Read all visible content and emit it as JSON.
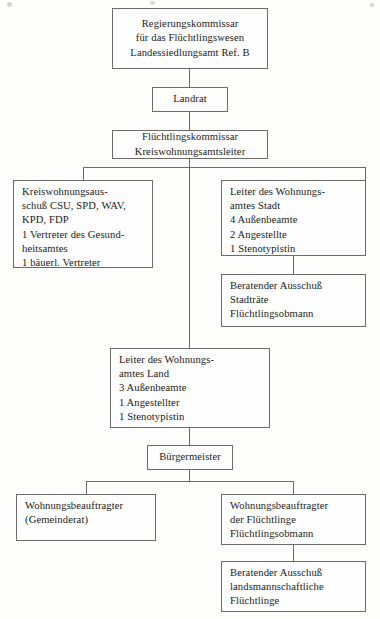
{
  "diagram": {
    "accent_color": "#6e6c69",
    "text_color": "#1b1a18",
    "background_color": "#fdfdfc"
  },
  "nodes": {
    "regierungskommissar": {
      "lines": [
        "Regierungskommissar",
        "für das Flüchtlingswesen",
        "Landessiedlungsamt Ref. B"
      ]
    },
    "landrat": {
      "lines": [
        "Landrat"
      ]
    },
    "fluechtlingskommissar": {
      "lines": [
        "Flüchtlingskommissar",
        "Kreiswohnungsamtsleiter"
      ]
    },
    "kreiswohnungsausschuss": {
      "lines": [
        "Kreiswohnungsaus-",
        "schuß CSU, SPD, WAV,",
        "KPD, FDP",
        "1 Vertreter des Gesund-",
        "heitsamtes",
        "1 bäuerl. Vertreter"
      ]
    },
    "leiter_wohnungsamt_stadt": {
      "lines": [
        "Leiter des Wohnungs-",
        "amtes Stadt",
        "4 Außenbeamte",
        "2 Angestellte",
        "1 Stenotypistin"
      ]
    },
    "beratender_ausschuss_stadt": {
      "lines": [
        "Beratender Ausschuß",
        "Stadträte",
        "Flüchtlingsobmann"
      ]
    },
    "leiter_wohnungsamt_land": {
      "lines": [
        "Leiter des Wohnungs-",
        "amtes Land",
        "3 Außenbeamte",
        "1 Angestellter",
        "1 Stenotypistin"
      ]
    },
    "buergermeister": {
      "lines": [
        "Bürgermeister"
      ]
    },
    "wohnungsbeauftragter_gemeinderat": {
      "lines": [
        "Wohnungsbeauftragter",
        "(Gemeinderat)"
      ]
    },
    "wohnungsbeauftragter_fluechtlinge": {
      "lines": [
        "Wohnungsbeauftragter",
        "der Flüchtlinge",
        "Flüchtlingsobmann"
      ]
    },
    "beratender_ausschuss_landsmannschaftlich": {
      "lines": [
        "Beratender Ausschuß",
        "landsmannschaftliche",
        "Flüchtlinge"
      ]
    }
  }
}
